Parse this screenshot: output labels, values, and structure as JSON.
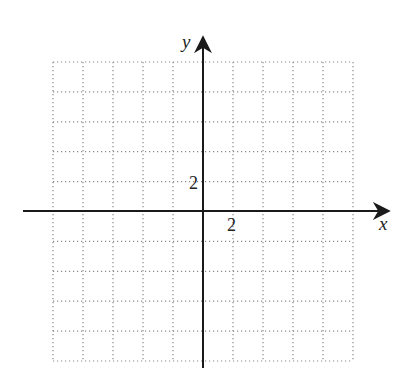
{
  "chart_data": {
    "type": "scatter",
    "title": "",
    "xlabel": "x",
    "ylabel": "y",
    "xlim": [
      -10,
      10
    ],
    "ylim": [
      -10,
      10
    ],
    "grid": true,
    "grid_style": "dotted",
    "grid_step": 2,
    "tick_labels": {
      "x": [
        "2"
      ],
      "y": [
        "2"
      ]
    },
    "series": [],
    "colors": {
      "axis": "#1a1a1a",
      "grid": "#8a8a8a",
      "background": "#ffffff"
    }
  },
  "axes": {
    "x_label": "x",
    "y_label": "y",
    "x_tick_label": "2",
    "y_tick_label": "2"
  }
}
